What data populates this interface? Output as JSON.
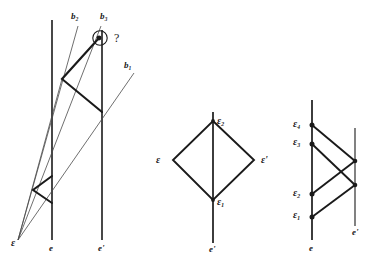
{
  "figure": {
    "stroke_color": "#1a1a1a",
    "background": "#ffffff"
  },
  "panel_left": {
    "name": "left-panel",
    "labels": {
      "b1": "b₁",
      "b2": "b₂",
      "b3": "b₃",
      "question": "?",
      "epsilon": "ε",
      "line_e": "e",
      "line_e_prime": "e'"
    },
    "lines": {
      "e_x": 52,
      "e_top": 20,
      "e_bottom": 240,
      "e_prime_x": 102,
      "e_prime_top": 30,
      "e_prime_bottom": 240
    },
    "apex": {
      "x": 18,
      "y": 240
    },
    "marked_point": {
      "x": 99,
      "y": 38,
      "circled": true
    },
    "rays": [
      {
        "id": "b1",
        "from": [
          18,
          240
        ],
        "to": [
          134,
          73
        ]
      },
      {
        "id": "b2",
        "from": [
          18,
          240
        ],
        "to": [
          78,
          26
        ]
      },
      {
        "id": "b3",
        "from": [
          18,
          240
        ],
        "to": [
          101,
          26
        ]
      }
    ],
    "zigzag_upper": [
      [
        99,
        38
      ],
      [
        62,
        79
      ],
      [
        102,
        112
      ]
    ],
    "zigzag_lower": [
      [
        51,
        176
      ],
      [
        33,
        190
      ],
      [
        52,
        203
      ]
    ]
  },
  "panel_middle": {
    "name": "middle-panel",
    "labels": {
      "epsilon": "ε",
      "epsilon_prime": "ε'",
      "epsilon_1": "ε₁",
      "epsilon_2": "ε₂",
      "line_e_prime": "e'"
    },
    "vertical_line": {
      "x": 213,
      "top": 112,
      "bottom": 243
    },
    "diamond": {
      "top": [
        213,
        121
      ],
      "right": [
        254,
        160
      ],
      "bottom": [
        213,
        200
      ],
      "left": [
        173,
        160
      ]
    }
  },
  "panel_right": {
    "name": "right-panel",
    "labels": {
      "epsilon_1": "ε₁",
      "epsilon_2": "ε₂",
      "epsilon_3": "ε₃",
      "epsilon_4": "ε₄",
      "line_e": "e",
      "line_e_prime": "e'"
    },
    "line_e": {
      "x": 312,
      "top": 100,
      "bottom": 240
    },
    "line_e_prime": {
      "x": 355,
      "top": 128,
      "bottom": 226
    },
    "points_on_e": [
      {
        "id": "e1",
        "x": 312,
        "y": 217
      },
      {
        "id": "e2",
        "x": 312,
        "y": 194
      },
      {
        "id": "e3",
        "x": 312,
        "y": 144
      },
      {
        "id": "e4",
        "x": 312,
        "y": 125
      }
    ],
    "points_on_e_prime": [
      {
        "id": "p_upper",
        "x": 355,
        "y": 161
      },
      {
        "id": "p_lower",
        "x": 355,
        "y": 185
      }
    ],
    "segments": [
      {
        "from": [
          312,
          125
        ],
        "to": [
          355,
          161
        ]
      },
      {
        "from": [
          355,
          161
        ],
        "to": [
          312,
          194
        ]
      },
      {
        "from": [
          312,
          144
        ],
        "to": [
          355,
          185
        ]
      },
      {
        "from": [
          355,
          185
        ],
        "to": [
          312,
          217
        ]
      }
    ]
  }
}
